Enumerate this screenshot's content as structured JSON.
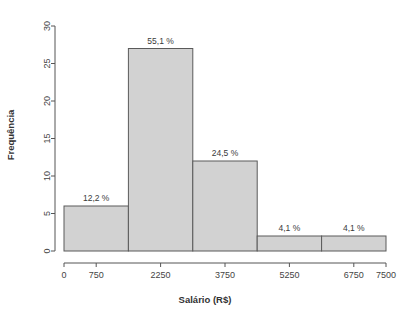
{
  "chart_data": {
    "type": "bar",
    "title": "",
    "subtitle": "",
    "xlabel": "Salário (R$)",
    "ylabel": "Frequência",
    "xlim": [
      0,
      7500
    ],
    "ylim": [
      0,
      30
    ],
    "grid": false,
    "legend": null,
    "x_ticks": [
      "0",
      "750",
      "2250",
      "3750",
      "5250",
      "6750",
      "7500"
    ],
    "x_tick_values": [
      0,
      750,
      2250,
      3750,
      5250,
      6750,
      7500
    ],
    "y_ticks": [
      "0",
      "5",
      "10",
      "15",
      "20",
      "25",
      "30"
    ],
    "y_tick_values": [
      0,
      5,
      10,
      15,
      20,
      25,
      30
    ],
    "bin_edges": [
      0,
      1500,
      3000,
      4500,
      6000,
      7500
    ],
    "categories": [
      "0-1500",
      "1500-3000",
      "3000-4500",
      "4500-6000",
      "6000-7500"
    ],
    "values": [
      6,
      27,
      12,
      2,
      2
    ],
    "annotations": [
      "12,2 %",
      "55,1 %",
      "24,5 %",
      "4,1 %",
      "4,1 %"
    ],
    "bar_fill_color": "#d2d2d2",
    "bar_border_color": "#5a5a5a",
    "axis_color": "#555555",
    "background_color": "#ffffff"
  }
}
